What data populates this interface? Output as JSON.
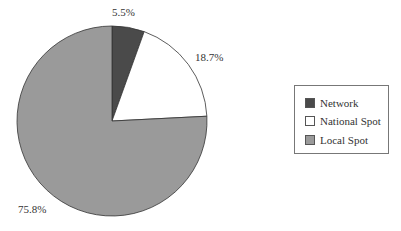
{
  "chart_data": {
    "type": "pie",
    "title": "",
    "categories": [
      "Network",
      "National Spot",
      "Local Spot"
    ],
    "values": [
      5.5,
      18.7,
      75.8
    ],
    "labels": [
      "5.5%",
      "18.7%",
      "75.8%"
    ],
    "colors": [
      "#4a4a4a",
      "#ffffff",
      "#9a9a9a"
    ],
    "start_angle_deg": 0,
    "direction": "clockwise",
    "legend_position": "right"
  },
  "legend": {
    "items": [
      {
        "label": "Network",
        "color": "#4a4a4a"
      },
      {
        "label": "National Spot",
        "color": "#ffffff"
      },
      {
        "label": "Local Spot",
        "color": "#9a9a9a"
      }
    ]
  }
}
